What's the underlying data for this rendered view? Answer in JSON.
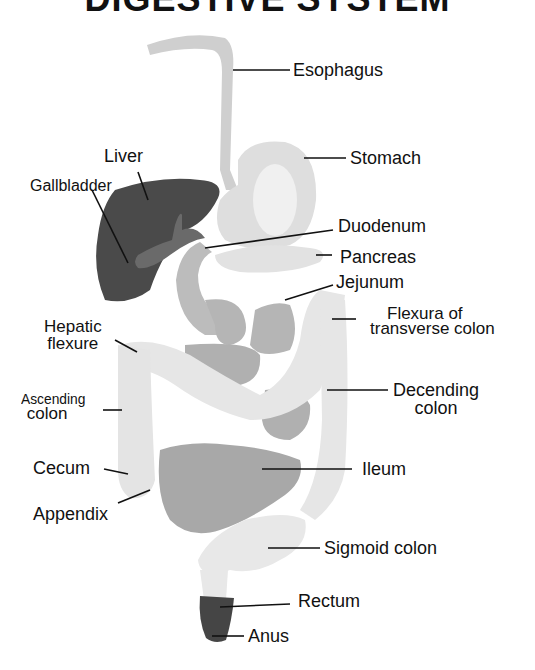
{
  "title": "DIGESTIVE SYSTEM",
  "colors": {
    "liver": "#4a4a4a",
    "esophagus": "#cfcfcf",
    "stomach": "#dedede",
    "small_intestine": "#b5b5b5",
    "large_intestine": "#e6e6e6",
    "rectum": "#454545",
    "leader_line": "#111111"
  },
  "labels": {
    "esophagus": "Esophagus",
    "stomach": "Stomach",
    "liver": "Liver",
    "gallbladder": "Gallbladder",
    "duodenum": "Duodenum",
    "pancreas": "Pancreas",
    "jejunum": "Jejunum",
    "flexura_line1": "Flexura of",
    "flexura_line2": "transverse colon",
    "hepatic_line1": "Hepatic",
    "hepatic_line2": "flexure",
    "ascending_line1": "Ascending",
    "ascending_line2": "colon",
    "decending_line1": "Decending",
    "decending_line2": "colon",
    "cecum": "Cecum",
    "ileum": "Ileum",
    "appendix": "Appendix",
    "sigmoid": "Sigmoid colon",
    "rectum": "Rectum",
    "anus": "Anus"
  }
}
